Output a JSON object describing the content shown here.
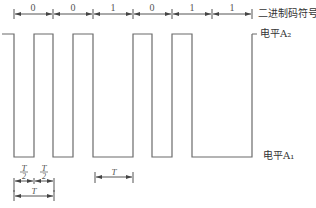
{
  "diagram": {
    "type": "manchester-waveform",
    "bits": [
      "0",
      "0",
      "1",
      "0",
      "1",
      "1"
    ],
    "bit_boundaries_x": [
      14,
      53,
      93,
      133,
      172,
      212,
      252
    ],
    "levels": {
      "high_y": 34,
      "low_y": 157
    },
    "labels": {
      "binary_symbols": "二进制码符号",
      "level_high": "电平A₂",
      "level_low": "电平A₁"
    },
    "dimensions": {
      "half_period_numerator": "T",
      "half_period_denominator": "2",
      "period": "T"
    },
    "colors": {
      "line": "#6b6b6b",
      "text": "#444444",
      "background": "#ffffff"
    }
  }
}
